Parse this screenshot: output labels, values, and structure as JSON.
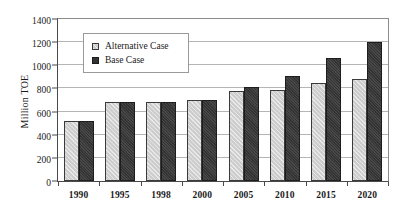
{
  "chart_data": {
    "type": "bar",
    "title": "",
    "xlabel": "",
    "ylabel": "Million TOE",
    "ylim": [
      0,
      1400
    ],
    "ytick_step": 200,
    "yticks": [
      0,
      200,
      400,
      600,
      800,
      1000,
      1200,
      1400
    ],
    "ytick_labels": [
      "0",
      "200",
      "400",
      "600",
      "800",
      "1000",
      "1200",
      "1400"
    ],
    "categories": [
      "1990",
      "1995",
      "1998",
      "2000",
      "2005",
      "2010",
      "2015",
      "2020"
    ],
    "grid": true,
    "legend_position": "upper-left-inside",
    "series": [
      {
        "name": "Alternative Case",
        "color": "#cdcdcd",
        "values": [
          520,
          680,
          680,
          700,
          775,
          785,
          845,
          880
        ]
      },
      {
        "name": "Base Case",
        "color": "#333333",
        "values": [
          520,
          680,
          680,
          700,
          810,
          905,
          1065,
          1205
        ]
      }
    ]
  },
  "legend": {
    "items": [
      {
        "label": "Alternative Case",
        "swatch": "alternative-case-swatch"
      },
      {
        "label": "Base Case",
        "swatch": "base-case-swatch"
      }
    ]
  }
}
